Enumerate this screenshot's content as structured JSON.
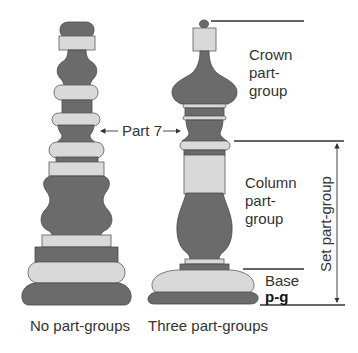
{
  "colors": {
    "dark": "#6b6b6b",
    "light": "#d9d9d9",
    "outline": "#4a4a4a",
    "line": "#333333",
    "text": "#333333",
    "background": "#ffffff"
  },
  "diagram": {
    "left_piece": {
      "caption": "No part-groups"
    },
    "right_piece": {
      "caption": "Three part-groups"
    },
    "pointer_label": "Part 7",
    "groups": {
      "crown": {
        "line1": "Crown",
        "line2": "part-",
        "line3": "group"
      },
      "column": {
        "line1": "Column",
        "line2": "part-",
        "line3": "group"
      },
      "base": {
        "line1": "Base",
        "line2": "p-g"
      },
      "set": {
        "label": "Set part-group"
      }
    }
  }
}
